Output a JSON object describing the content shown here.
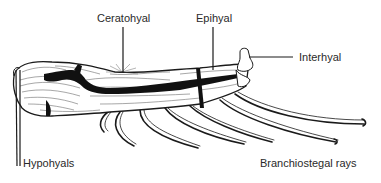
{
  "figure": {
    "labels": {
      "ceratohyal": "Ceratohyal",
      "epihyal": "Epihyal",
      "interhyal": "Interhyal",
      "hypohyals": "Hypohyals",
      "branchiostegal_rays": "Branchiostegal rays"
    },
    "colors": {
      "ink": "#1a1a1a",
      "text": "#2a2a2a",
      "background": "#ffffff"
    }
  }
}
